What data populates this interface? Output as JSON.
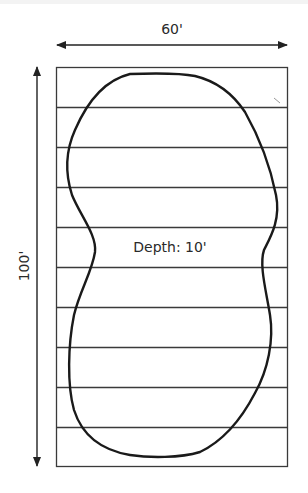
{
  "diagram": {
    "dimensions": {
      "width_label": "60'",
      "length_label": "100'",
      "depth_label": "Depth: 10'"
    },
    "grid": {
      "strips": 10,
      "line_color": "#3a3a3a"
    },
    "pool_outline": {
      "shape": "peanut / kidney",
      "stroke_color": "#1a1a1a"
    },
    "colors": {
      "background": "#ffffff",
      "lines": "#333333",
      "text": "#2a2a2a"
    }
  }
}
